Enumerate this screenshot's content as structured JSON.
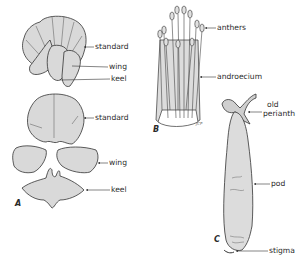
{
  "figure": {
    "background": "#ffffff",
    "fill_color": "#d9d9d9",
    "stroke_color": "#333333",
    "panels": [
      {
        "id": "A",
        "label": "A",
        "description": "Papilionaceous flower, intact and dissected",
        "callouts": [
          {
            "text": "standard",
            "target": "standard petal (intact flower)"
          },
          {
            "text": "wing",
            "target": "wing petal (intact flower)"
          },
          {
            "text": "keel",
            "target": "keel petal (intact flower)"
          },
          {
            "text": "standard",
            "target": "standard petal (dissected)"
          },
          {
            "text": "wing",
            "target": "wing petals (dissected)"
          },
          {
            "text": "keel",
            "target": "keel petals (dissected)"
          }
        ]
      },
      {
        "id": "B",
        "label": "B",
        "description": "Androecium with anthers",
        "callouts": [
          {
            "text": "anthers",
            "target": "anthers at filament tips"
          },
          {
            "text": "androecium",
            "target": "staminal tube"
          }
        ],
        "signature": "JCP"
      },
      {
        "id": "C",
        "label": "C",
        "description": "Legume pod",
        "callouts": [
          {
            "text": "old perianth",
            "line1": "old",
            "line2": "perianth",
            "target": "withered perianth at pod base"
          },
          {
            "text": "pod",
            "target": "legume pod"
          },
          {
            "text": "stigma",
            "target": "stigma at pod tip"
          }
        ]
      }
    ]
  }
}
